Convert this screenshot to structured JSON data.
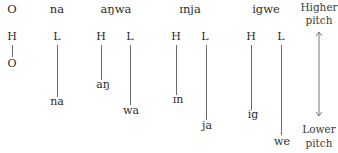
{
  "words": [
    {
      "word": "O",
      "tones": [
        {
          "tone": "H",
          "syllable": "O",
          "level": "high"
        }
      ]
    },
    {
      "word": "na",
      "tones": [
        {
          "tone": "L",
          "syllable": "na",
          "level": "low"
        }
      ]
    },
    {
      "word": "aŋwa",
      "tones": [
        {
          "tone": "H",
          "syllable": "aŋ",
          "level": "high"
        },
        {
          "tone": "L",
          "syllable": "wa",
          "level": "low"
        }
      ]
    },
    {
      "word": "ɪnja",
      "tones": [
        {
          "tone": "H",
          "syllable": "ɪn",
          "level": "high"
        },
        {
          "tone": "L",
          "syllable": "ja",
          "level": "low"
        }
      ]
    },
    {
      "word": "igwe",
      "tones": [
        {
          "tone": "H",
          "syllable": "ig",
          "level": "high"
        },
        {
          "tone": "L",
          "syllable": "we",
          "level": "low"
        }
      ]
    }
  ],
  "scale": {
    "top_label_1": "Higher",
    "top_label_2": "pitch",
    "bottom_label_1": "Lower",
    "bottom_label_2": "pitch"
  }
}
